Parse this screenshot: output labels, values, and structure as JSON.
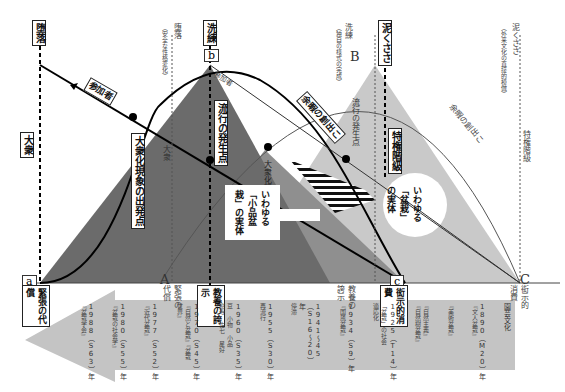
{
  "points": {
    "a": "a",
    "b": "b",
    "c": "c",
    "A": "A",
    "B": "B",
    "C": "C"
  },
  "top_labels": {
    "daraku": "堕落",
    "daraku_gray": "堕落",
    "daraku_gray_sub": "（安全な性格変化）",
    "senren": "洗練",
    "senren_gray": "洗練",
    "senren_gray_sub": "（独自の様式の完成）",
    "dorokusasa": "泥くささ",
    "dorokusasa_gray": "泥くささ",
    "dorokusasa_gray_sub": "（外来文化の直接的模倣）"
  },
  "side_labels": {
    "taishu": "大衆",
    "taishu_gray": "大衆",
    "tokken": "特権階級",
    "tokken_gray": "特権階級"
  },
  "curve_labels": {
    "sankasha": "参加者",
    "sankasha_gray": "参加者",
    "yosei": "余暇の創出こ",
    "yosei_gray": "余暇の創出こ"
  },
  "inner_labels": {
    "taishuka_start": "大衆化現象の出発点",
    "taishuka_start_gray": "大衆化現象の出発点",
    "ryuko_start": "流行の発生点",
    "ryuko_start_gray": "流行の発生点",
    "shohin_bonsai": "いわゆる「小品盆栽」の実体",
    "bonsai_jittai": "いわゆる「盆栽」の実体"
  },
  "bottom_labels": {
    "kincho_daisho": "緊張の代償",
    "kincho_daisho_gray": "緊張の代償",
    "kyoyo_koji": "教養の誇示",
    "kyoyo_koji_gray": "教養の誇示",
    "koji_shohi": "衒示的消費",
    "koji_shohi_gray": "衒示的消費"
  },
  "timeline": [
    {
      "year": "1988（S63）年",
      "title": "『盆栽学会』"
    },
    {
      "year": "1980（S55）年",
      "title": "『盆栽の社会学』"
    },
    {
      "year": "1977（S52）年",
      "title": "『近代盆栽』"
    },
    {
      "year": "1970（S45）年",
      "title": "『自然と盆栽』『盆栽世界』"
    },
    {
      "year": "1960（S35）年",
      "title": "豆 小物 小品　　樹寿 佐七 星好"
    },
    {
      "year": "1955（S30）年",
      "title": "再流行"
    },
    {
      "year": "1941〜45（S16〜20）年",
      "title": "停滞"
    },
    {
      "year": "1934（S9）年",
      "title": "『国風盆栽』"
    },
    {
      "year": "1925（T14）年",
      "title": "「盆栽」の社会適応化"
    },
    {
      "year": "",
      "title": "『自然主義』『自然樹盆栽』"
    },
    {
      "year": "",
      "title": "『美術盆栽』"
    },
    {
      "year": "1890（M20）年",
      "title": "『文人盆栽』"
    },
    {
      "year": "",
      "title": "園芸文化"
    }
  ],
  "colors": {
    "dark_triangle": "#6b6b6b",
    "mid_triangle": "#8f8f8f",
    "light_triangle": "#c9c9c9",
    "arrow": "#c4c4c4"
  }
}
